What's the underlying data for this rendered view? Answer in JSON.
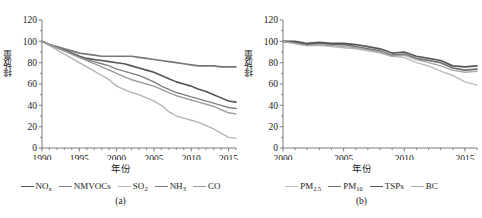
{
  "figure": {
    "panels": [
      {
        "id": "a",
        "caption": "(a)",
        "ylabel": "排放量",
        "xlabel": "年份"
      },
      {
        "id": "b",
        "caption": "(b)",
        "ylabel": "排放量",
        "xlabel": "年份"
      }
    ]
  },
  "chart_data": [
    {
      "type": "line",
      "panel": "a",
      "title": "",
      "xlabel": "年份",
      "ylabel": "排放量",
      "xlim": [
        1990,
        2016
      ],
      "ylim": [
        0,
        120
      ],
      "xticks": [
        1990,
        1995,
        2000,
        2005,
        2010,
        2015
      ],
      "yticks": [
        0,
        20,
        40,
        60,
        80,
        100,
        120
      ],
      "grid": false,
      "legend_position": "below",
      "x": [
        1990,
        1991,
        1992,
        1993,
        1994,
        1995,
        1996,
        1997,
        1998,
        1999,
        2000,
        2001,
        2002,
        2003,
        2004,
        2005,
        2006,
        2007,
        2008,
        2009,
        2010,
        2011,
        2012,
        2013,
        2014,
        2015,
        2016
      ],
      "series": [
        {
          "name": "NOx",
          "label_html": "NO<sub>x</sub>",
          "color": "#555555",
          "width": 1.6,
          "values": [
            100,
            97,
            94,
            92,
            89,
            86,
            84,
            83,
            82,
            81,
            80,
            79,
            77,
            75,
            73,
            71,
            68,
            65,
            62,
            60,
            58,
            55,
            53,
            50,
            47,
            44,
            43
          ]
        },
        {
          "name": "NMVOCs",
          "label_html": "NMVOCs",
          "color": "#808080",
          "width": 1.4,
          "values": [
            100,
            97,
            94,
            91,
            88,
            85,
            83,
            81,
            79,
            77,
            74,
            72,
            70,
            68,
            65,
            62,
            58,
            55,
            52,
            50,
            48,
            46,
            44,
            42,
            40,
            38,
            37
          ]
        },
        {
          "name": "SO2",
          "label_html": "SO<sub>2</sub>",
          "color": "#b5b5b5",
          "width": 1.4,
          "values": [
            100,
            96,
            92,
            88,
            84,
            80,
            76,
            72,
            68,
            64,
            58,
            55,
            52,
            50,
            47,
            44,
            40,
            34,
            30,
            28,
            26,
            24,
            21,
            18,
            14,
            10,
            9
          ]
        },
        {
          "name": "NH3",
          "label_html": "NH<sub>3</sub>",
          "color": "#777777",
          "width": 1.7,
          "values": [
            100,
            97,
            95,
            93,
            91,
            89,
            88,
            87,
            86,
            86,
            86,
            86,
            86,
            85,
            84,
            83,
            82,
            81,
            80,
            79,
            78,
            77,
            77,
            77,
            76,
            76,
            76
          ]
        },
        {
          "name": "CO",
          "label_html": "CO",
          "color": "#9a9a9a",
          "width": 1.4,
          "values": [
            100,
            97,
            94,
            91,
            88,
            85,
            82,
            79,
            76,
            73,
            70,
            67,
            64,
            62,
            60,
            58,
            55,
            52,
            49,
            47,
            45,
            43,
            41,
            39,
            36,
            33,
            32
          ]
        }
      ]
    },
    {
      "type": "line",
      "panel": "b",
      "title": "",
      "xlabel": "年份",
      "ylabel": "排放量",
      "xlim": [
        2000,
        2016
      ],
      "ylim": [
        0,
        120
      ],
      "xticks": [
        2000,
        2005,
        2010,
        2015
      ],
      "yticks": [
        0,
        20,
        40,
        60,
        80,
        100,
        120
      ],
      "grid": false,
      "legend_position": "below",
      "x": [
        2000,
        2001,
        2002,
        2003,
        2004,
        2005,
        2006,
        2007,
        2008,
        2009,
        2010,
        2011,
        2012,
        2013,
        2014,
        2015,
        2016
      ],
      "series": [
        {
          "name": "PM2.5",
          "label_html": "PM<sub>2.5</sub>",
          "color": "#bcbcbc",
          "width": 1.4,
          "values": [
            100,
            98,
            96,
            96,
            95,
            94,
            93,
            91,
            89,
            86,
            85,
            80,
            77,
            72,
            68,
            62,
            59
          ]
        },
        {
          "name": "PM10",
          "label_html": "PM<sub>10</sub>",
          "color": "#6e6e6e",
          "width": 1.7,
          "values": [
            100,
            99,
            97,
            98,
            97,
            97,
            95,
            93,
            91,
            87,
            88,
            84,
            82,
            80,
            75,
            73,
            74
          ]
        },
        {
          "name": "TSPs",
          "label_html": "TSPs",
          "color": "#565656",
          "width": 1.7,
          "values": [
            100,
            100,
            98,
            99,
            98,
            98,
            97,
            95,
            93,
            89,
            90,
            86,
            84,
            82,
            77,
            76,
            77
          ]
        },
        {
          "name": "BC",
          "label_html": "BC",
          "color": "#a8a8a8",
          "width": 1.4,
          "values": [
            100,
            98,
            96,
            97,
            96,
            95,
            94,
            92,
            90,
            86,
            87,
            83,
            80,
            77,
            73,
            71,
            72
          ]
        }
      ]
    }
  ]
}
